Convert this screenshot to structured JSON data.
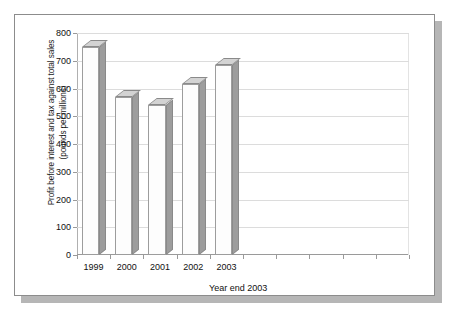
{
  "chart_data": {
    "type": "bar",
    "title": "",
    "subtitle": "",
    "xlabel": "Year end 2003",
    "ylabel": "Profit before interest and tax against total sales\n(pounds per millions)",
    "categories": [
      "1999",
      "2000",
      "2001",
      "2002",
      "2003"
    ],
    "values": [
      750,
      570,
      540,
      615,
      685
    ],
    "series": [
      {
        "name": "Profit before interest and tax against total sales",
        "values": [
          750,
          570,
          540,
          615,
          685
        ]
      }
    ],
    "ylim": [
      0,
      800
    ],
    "y_ticks": [
      0,
      100,
      200,
      300,
      400,
      500,
      600,
      700,
      800
    ],
    "y_tick_labels": [
      "0",
      "100",
      "200",
      "300",
      "400",
      "500",
      "600",
      "700",
      "800"
    ],
    "empty_category_slots": 5,
    "grid": true,
    "grid_axis": "y",
    "legend": false,
    "legend_position": "none",
    "bar_style": "3d",
    "units": "pounds per millions"
  },
  "style": {
    "bar_front_color": "#fdfdfd",
    "bar_side_color": "#9d9d9d",
    "bar_top_color": "#d3d3d3",
    "bar_edge_color": "#8a8a8a",
    "gridline_color": "#dcdcdc",
    "axis_color": "#9a9a9a",
    "text_color": "#111111",
    "frame_border_color": "#8c8c8c",
    "shadow_color": "#b6b6b6",
    "background_color": "#ffffff"
  }
}
